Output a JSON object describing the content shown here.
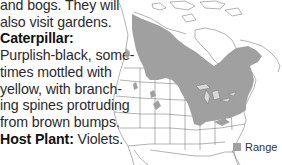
{
  "text": {
    "lines": [
      "and bogs. They will",
      "also visit gardens."
    ],
    "caterpillar_heading": "Caterpillar:",
    "caterpillar_lines": [
      "Purplish-black, some-",
      "times mottled with",
      "yellow, with branch-",
      "ing spines protruding",
      "from brown bumps."
    ],
    "host_plant_heading": "Host Plant:",
    "host_plant_value": " Violets."
  },
  "map": {
    "range_color": "#a0a0a0",
    "border_color": "#555555",
    "legend": {
      "label": "Range",
      "swatch_color": "#a0a0a0"
    }
  }
}
